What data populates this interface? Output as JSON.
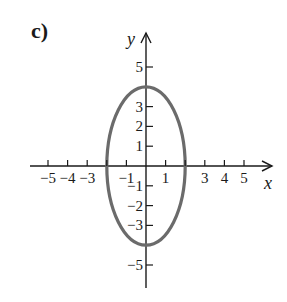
{
  "panel_label": "c)",
  "chart_data": {
    "type": "line",
    "title": "",
    "xlabel": "x",
    "ylabel": "y",
    "xlim": [
      -6,
      6
    ],
    "ylim": [
      -6,
      6
    ],
    "grid": false,
    "x_ticks": [
      -5,
      -4,
      -3,
      -2,
      -1,
      1,
      2,
      3,
      4,
      5
    ],
    "x_tick_labels": [
      "−5",
      "−4",
      "−3",
      "",
      "−1",
      "1",
      "",
      "3",
      "4",
      "5"
    ],
    "y_ticks": [
      5,
      3,
      2,
      1,
      -1,
      -2,
      -3,
      -5
    ],
    "y_tick_labels": [
      "5",
      "3",
      "2",
      "1",
      "−1",
      "−2",
      "−3",
      "−5"
    ],
    "series": [
      {
        "name": "ellipse",
        "equation": "x^2/4 + y^2/16 = 1",
        "center": [
          0,
          0
        ],
        "semi_axis_x": 2,
        "semi_axis_y": 4,
        "color": "#6b6b6b",
        "vertices": [
          [
            0,
            4
          ],
          [
            0,
            -4
          ],
          [
            2,
            0
          ],
          [
            -2,
            0
          ]
        ]
      }
    ]
  },
  "layout": {
    "origin_px": [
      146,
      166
    ],
    "unit_px_x": 19.6,
    "unit_px_y": 19.8,
    "x_axis_start_px": 30,
    "x_axis_end_px": 272,
    "y_axis_top_px": 33,
    "y_axis_bottom_px": 288
  }
}
